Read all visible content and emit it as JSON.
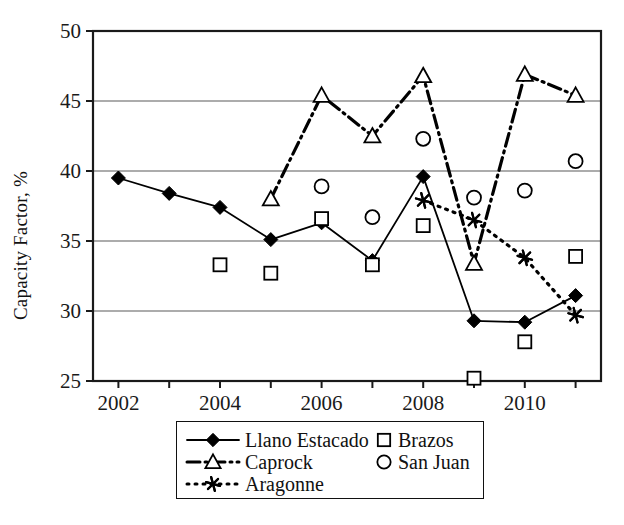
{
  "chart_data": {
    "type": "line",
    "title": "",
    "xlabel": "",
    "ylabel": "Capacity Factor, %",
    "xlim": [
      2001.5,
      2011.5
    ],
    "ylim": [
      25,
      50
    ],
    "ytick_values": [
      25,
      30,
      35,
      40,
      45,
      50
    ],
    "ytick_labels": [
      "25",
      "30",
      "35",
      "40",
      "45",
      "50"
    ],
    "xtick_values": [
      2002,
      2003,
      2004,
      2005,
      2006,
      2007,
      2008,
      2009,
      2010,
      2011
    ],
    "xtick_labels": [
      "2002",
      "",
      "2004",
      "",
      "2006",
      "",
      "2008",
      "",
      "2010",
      ""
    ],
    "grid": "horizontal",
    "legend_position": "below-center",
    "series": [
      {
        "name": "Llano Estacado",
        "marker": "filled-diamond",
        "line": "solid",
        "x": [
          2002,
          2003,
          2004,
          2005,
          2006,
          2007,
          2008,
          2009,
          2010,
          2011
        ],
        "values": [
          39.5,
          38.4,
          37.4,
          35.1,
          36.3,
          33.6,
          39.6,
          29.3,
          29.2,
          31.1
        ]
      },
      {
        "name": "Caprock",
        "marker": "open-triangle",
        "line": "dash-dot",
        "x": [
          2005,
          2006,
          2007,
          2008,
          2009,
          2010,
          2011
        ],
        "values": [
          38.0,
          45.4,
          42.5,
          46.8,
          33.4,
          46.9,
          45.4
        ]
      },
      {
        "name": "Aragonne",
        "marker": "asterisk",
        "line": "dotted",
        "x": [
          2008,
          2009,
          2010,
          2011
        ],
        "values": [
          37.9,
          36.5,
          33.8,
          29.7
        ]
      },
      {
        "name": "Brazos",
        "marker": "open-square",
        "line": "none",
        "x": [
          2004,
          2005,
          2006,
          2007,
          2008,
          2009,
          2010,
          2011
        ],
        "values": [
          33.3,
          32.7,
          36.6,
          33.3,
          36.1,
          25.2,
          27.8,
          33.9
        ]
      },
      {
        "name": "San Juan",
        "marker": "open-circle",
        "line": "none",
        "x": [
          2006,
          2007,
          2008,
          2009,
          2010,
          2011
        ],
        "values": [
          38.9,
          36.7,
          42.3,
          38.1,
          38.6,
          40.7
        ]
      }
    ]
  },
  "legend": {
    "left_column": [
      "Llano Estacado",
      "Caprock",
      "Aragonne"
    ],
    "right_column": [
      "Brazos",
      "San Juan"
    ]
  },
  "colors": {
    "line": "#000000",
    "grid": "#5a5a5a",
    "axis": "#1a1a1a",
    "background": "#ffffff"
  }
}
